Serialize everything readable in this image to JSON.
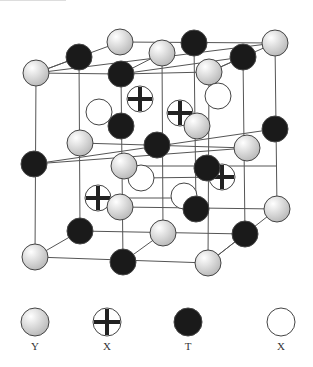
{
  "diagram": {
    "type": "crystal-structure",
    "colors": {
      "gray_fill": "#d8d8d8",
      "black_fill": "#1a1a1a",
      "line": "#555555",
      "white_fill": "#ffffff"
    },
    "atoms": [
      {
        "kind": "Y",
        "x": 36,
        "y": 73
      },
      {
        "kind": "T",
        "x": 79,
        "y": 57
      },
      {
        "kind": "Y",
        "x": 120,
        "y": 42
      },
      {
        "kind": "T",
        "x": 121,
        "y": 74
      },
      {
        "kind": "X_cross",
        "x": 140,
        "y": 99
      },
      {
        "kind": "X_open",
        "x": 99,
        "y": 112
      },
      {
        "kind": "T",
        "x": 194,
        "y": 43
      },
      {
        "kind": "Y",
        "x": 275,
        "y": 43
      },
      {
        "kind": "T",
        "x": 243,
        "y": 57
      },
      {
        "kind": "Y",
        "x": 162,
        "y": 53
      },
      {
        "kind": "Y",
        "x": 209,
        "y": 72
      },
      {
        "kind": "X_open",
        "x": 218,
        "y": 96
      },
      {
        "kind": "X_cross",
        "x": 180,
        "y": 113
      },
      {
        "kind": "Y",
        "x": 197,
        "y": 126
      },
      {
        "kind": "T",
        "x": 275,
        "y": 129
      },
      {
        "kind": "T",
        "x": 34,
        "y": 164
      },
      {
        "kind": "Y",
        "x": 80,
        "y": 143
      },
      {
        "kind": "T",
        "x": 121,
        "y": 126
      },
      {
        "kind": "T",
        "x": 157,
        "y": 145
      },
      {
        "kind": "Y",
        "x": 247,
        "y": 148
      },
      {
        "kind": "X_open",
        "x": 141,
        "y": 178
      },
      {
        "kind": "Y",
        "x": 124,
        "y": 166
      },
      {
        "kind": "X_cross",
        "x": 222,
        "y": 177
      },
      {
        "kind": "T",
        "x": 207,
        "y": 168
      },
      {
        "kind": "X_cross",
        "x": 98,
        "y": 198
      },
      {
        "kind": "X_open",
        "x": 184,
        "y": 196
      },
      {
        "kind": "Y",
        "x": 120,
        "y": 207
      },
      {
        "kind": "T",
        "x": 196,
        "y": 209
      },
      {
        "kind": "Y",
        "x": 277,
        "y": 209
      },
      {
        "kind": "T",
        "x": 80,
        "y": 231
      },
      {
        "kind": "Y",
        "x": 163,
        "y": 233
      },
      {
        "kind": "T",
        "x": 245,
        "y": 234
      },
      {
        "kind": "Y",
        "x": 35,
        "y": 257
      },
      {
        "kind": "T",
        "x": 123,
        "y": 262
      },
      {
        "kind": "Y",
        "x": 208,
        "y": 263
      }
    ],
    "lines": [
      [
        36,
        73,
        275,
        43
      ],
      [
        36,
        73,
        79,
        57
      ],
      [
        79,
        57,
        120,
        42
      ],
      [
        120,
        42,
        275,
        43
      ],
      [
        121,
        74,
        243,
        57
      ],
      [
        36,
        73,
        121,
        74
      ],
      [
        121,
        74,
        209,
        72
      ],
      [
        209,
        72,
        275,
        43
      ],
      [
        36,
        73,
        35,
        257
      ],
      [
        275,
        43,
        277,
        209
      ],
      [
        35,
        257,
        208,
        263
      ],
      [
        208,
        263,
        277,
        209
      ],
      [
        79,
        57,
        80,
        231
      ],
      [
        80,
        231,
        245,
        234
      ],
      [
        245,
        234,
        243,
        57
      ],
      [
        121,
        74,
        123,
        262
      ],
      [
        209,
        72,
        208,
        263
      ],
      [
        162,
        53,
        163,
        233
      ],
      [
        194,
        43,
        196,
        209
      ],
      [
        34,
        164,
        275,
        129
      ],
      [
        34,
        164,
        247,
        148
      ],
      [
        80,
        143,
        247,
        148
      ],
      [
        124,
        166,
        277,
        166
      ],
      [
        120,
        207,
        277,
        209
      ],
      [
        141,
        178,
        222,
        177
      ],
      [
        98,
        198,
        196,
        198
      ],
      [
        35,
        257,
        80,
        231
      ],
      [
        123,
        262,
        163,
        233
      ],
      [
        208,
        263,
        245,
        234
      ],
      [
        36,
        73,
        79,
        57
      ],
      [
        121,
        74,
        162,
        53
      ],
      [
        209,
        72,
        243,
        57
      ]
    ],
    "legend": [
      {
        "kind": "Y",
        "label": "Y",
        "x": 35
      },
      {
        "kind": "X_cross",
        "label": "X",
        "x": 107
      },
      {
        "kind": "T",
        "label": "T",
        "x": 188
      },
      {
        "kind": "X_open",
        "label": "X",
        "x": 281
      }
    ]
  }
}
